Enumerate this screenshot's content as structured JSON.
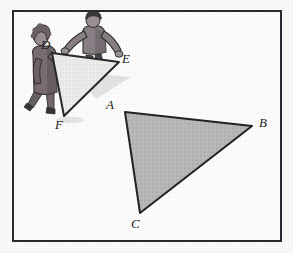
{
  "figure": {
    "kind": "geometry-illustration",
    "frame": {
      "x": 12,
      "y": 10,
      "width": 270,
      "height": 232,
      "border_color": "#2b2b33",
      "border_width": 2,
      "background": "#ffffff"
    },
    "background_color": "#fdfdfd"
  },
  "shapes": {
    "triangle_abc": {
      "name": "triangle-abc",
      "fill": "#b9b9b9",
      "stroke": "#232327",
      "stroke_width": 2,
      "vertices": [
        {
          "label": "A",
          "x": 125,
          "y": 112
        },
        {
          "label": "B",
          "x": 252,
          "y": 126
        },
        {
          "label": "C",
          "x": 140,
          "y": 213
        }
      ]
    },
    "triangle_def": {
      "name": "triangle-def",
      "fill": "#eeeeec",
      "stroke": "#2a2a2e",
      "stroke_width": 2,
      "vertices": [
        {
          "label": "D",
          "x": 52,
          "y": 53
        },
        {
          "label": "E",
          "x": 119,
          "y": 62
        },
        {
          "label": "F",
          "x": 64,
          "y": 116
        }
      ]
    }
  },
  "labels": {
    "A": "A",
    "B": "B",
    "C": "C",
    "D": "D",
    "E": "E",
    "F": "F"
  },
  "people": {
    "left_figure": {
      "name": "person-carrying-left",
      "hair_color": "#6e6368",
      "coat_color": "#7c6f74",
      "shade_color": "#5a5055",
      "outline_color": "#33302f"
    },
    "right_figure": {
      "name": "person-carrying-right",
      "hair_color": "#3c3a3c",
      "shirt_color": "#8b8288",
      "shade_color": "#5f585c",
      "outline_color": "#2f2d2d"
    }
  },
  "colors": {
    "ink": "#1b1b20",
    "shaded_fill": "#b9b9b9",
    "light_fill": "#eeeeec",
    "shadow": "#d9d9d9"
  }
}
